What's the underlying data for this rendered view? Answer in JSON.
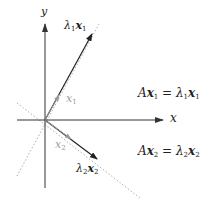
{
  "diagram": {
    "axes": {
      "x_label": "x",
      "y_label": "y"
    },
    "vectors": {
      "x1": {
        "label_base": "x",
        "label_sub": "1",
        "color": "#9a9a9a"
      },
      "lambda1_x1": {
        "lambda": "λ",
        "lambda_sub": "1",
        "base": "x",
        "sub": "1",
        "color": "#222222"
      },
      "x2": {
        "label_base": "x",
        "label_sub": "2",
        "color": "#9a9a9a"
      },
      "lambda2_x2": {
        "lambda": "λ",
        "lambda_sub": "2",
        "base": "x",
        "sub": "2",
        "color": "#222222"
      }
    },
    "equations": {
      "eq1": {
        "lhs_A": "A",
        "lhs_x": "x",
        "lhs_sub": "1",
        "equals": " = ",
        "rhs_lambda": "λ",
        "rhs_lambda_sub": "1",
        "rhs_x": "x",
        "rhs_sub": "1"
      },
      "eq2": {
        "lhs_A": "A",
        "lhs_x": "x",
        "lhs_sub": "2",
        "equals": " = ",
        "rhs_lambda": "λ",
        "rhs_lambda_sub": "2",
        "rhs_x": "x",
        "rhs_sub": "2"
      }
    },
    "colors": {
      "axis": "#333333",
      "eigen_dark": "#222222",
      "eigen_gray": "#9a9a9a",
      "dotted": "#9a9a9a"
    }
  }
}
